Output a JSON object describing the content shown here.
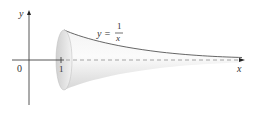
{
  "figure": {
    "axis_labels": {
      "x": "x",
      "y": "y"
    },
    "tick_labels": {
      "origin": "0",
      "one": "1"
    },
    "curve_label": {
      "lhs": "y =",
      "numerator": "1",
      "denominator": "x"
    },
    "colors": {
      "axis": "#444444",
      "surface": "#e6e6e6",
      "edge": "#555555",
      "dashed": "#9a9a9a"
    }
  }
}
